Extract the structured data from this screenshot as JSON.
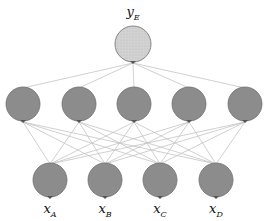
{
  "diagram": {
    "type": "neural-network",
    "output": {
      "label": "y",
      "sub": "E",
      "cx": 133,
      "cy": 44,
      "r": 18,
      "fill": "#cfcfcf"
    },
    "hidden": [
      {
        "cx": 23,
        "cy": 104,
        "r": 17
      },
      {
        "cx": 79,
        "cy": 104,
        "r": 17
      },
      {
        "cx": 134,
        "cy": 104,
        "r": 17
      },
      {
        "cx": 189,
        "cy": 104,
        "r": 17
      },
      {
        "cx": 245,
        "cy": 104,
        "r": 17
      }
    ],
    "inputs": [
      {
        "label": "x",
        "sub": "A",
        "cx": 50,
        "cy": 180,
        "r": 17
      },
      {
        "label": "x",
        "sub": "B",
        "cx": 105,
        "cy": 180,
        "r": 17
      },
      {
        "label": "x",
        "sub": "C",
        "cx": 160,
        "cy": 180,
        "r": 17
      },
      {
        "label": "x",
        "sub": "D",
        "cx": 216,
        "cy": 180,
        "r": 17
      }
    ],
    "colors": {
      "node": "#8c8c8c",
      "stroke": "#6e6e6e",
      "edge": "#c4c4c4",
      "output": "#cfcfcf"
    }
  },
  "labels": {
    "output": {
      "main": "y",
      "sub": "E"
    },
    "inputs": [
      {
        "main": "x",
        "sub": "A"
      },
      {
        "main": "x",
        "sub": "B"
      },
      {
        "main": "x",
        "sub": "C"
      },
      {
        "main": "x",
        "sub": "D"
      }
    ]
  }
}
